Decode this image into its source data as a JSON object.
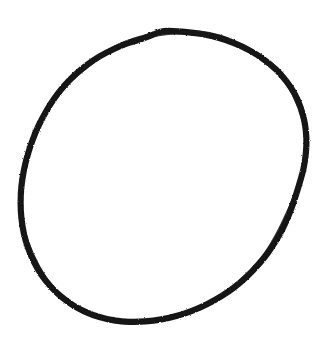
{
  "canvas": {
    "width": 335,
    "height": 355,
    "background_color": "#ffffff",
    "name": "drawing-canvas"
  },
  "artwork": {
    "type": "freehand-sketch",
    "subject": "circle",
    "description": "A single closed hand-drawn circle outline, slightly taller than wide, with a thick rough-edged black marker stroke.",
    "stroke_color": "#151515",
    "stroke_width": 6.2,
    "fill": "none",
    "closed": true,
    "bounds": {
      "left": 20,
      "top": 28,
      "right": 308,
      "bottom": 332,
      "width": 288,
      "height": 304
    },
    "center": {
      "x": 164,
      "y": 180
    },
    "radius_x": 144,
    "radius_y": 152,
    "points": [
      {
        "x": 164.0,
        "y": 31.0
      },
      {
        "x": 182.0,
        "y": 31.6
      },
      {
        "x": 200.0,
        "y": 33.8
      },
      {
        "x": 217.5,
        "y": 37.6
      },
      {
        "x": 234.0,
        "y": 43.2
      },
      {
        "x": 249.5,
        "y": 50.4
      },
      {
        "x": 263.5,
        "y": 59.2
      },
      {
        "x": 276.0,
        "y": 69.6
      },
      {
        "x": 286.5,
        "y": 81.4
      },
      {
        "x": 295.0,
        "y": 94.4
      },
      {
        "x": 301.0,
        "y": 108.4
      },
      {
        "x": 304.8,
        "y": 123.2
      },
      {
        "x": 306.4,
        "y": 138.4
      },
      {
        "x": 305.8,
        "y": 153.8
      },
      {
        "x": 303.4,
        "y": 169.2
      },
      {
        "x": 299.2,
        "y": 184.4
      },
      {
        "x": 294.6,
        "y": 199.2
      },
      {
        "x": 289.4,
        "y": 213.6
      },
      {
        "x": 283.2,
        "y": 227.6
      },
      {
        "x": 275.8,
        "y": 241.0
      },
      {
        "x": 267.2,
        "y": 253.8
      },
      {
        "x": 257.4,
        "y": 265.8
      },
      {
        "x": 246.4,
        "y": 277.0
      },
      {
        "x": 234.4,
        "y": 287.2
      },
      {
        "x": 221.4,
        "y": 296.2
      },
      {
        "x": 207.4,
        "y": 304.0
      },
      {
        "x": 192.6,
        "y": 310.6
      },
      {
        "x": 177.2,
        "y": 315.8
      },
      {
        "x": 161.4,
        "y": 319.4
      },
      {
        "x": 145.4,
        "y": 321.4
      },
      {
        "x": 129.6,
        "y": 321.8
      },
      {
        "x": 114.2,
        "y": 320.4
      },
      {
        "x": 99.4,
        "y": 317.0
      },
      {
        "x": 85.4,
        "y": 311.8
      },
      {
        "x": 72.4,
        "y": 304.8
      },
      {
        "x": 60.6,
        "y": 296.2
      },
      {
        "x": 50.2,
        "y": 286.0
      },
      {
        "x": 41.2,
        "y": 274.4
      },
      {
        "x": 33.8,
        "y": 261.6
      },
      {
        "x": 28.0,
        "y": 247.8
      },
      {
        "x": 23.8,
        "y": 233.2
      },
      {
        "x": 21.4,
        "y": 218.0
      },
      {
        "x": 20.6,
        "y": 202.4
      },
      {
        "x": 21.4,
        "y": 186.6
      },
      {
        "x": 23.8,
        "y": 170.8
      },
      {
        "x": 27.6,
        "y": 155.2
      },
      {
        "x": 32.6,
        "y": 140.0
      },
      {
        "x": 38.8,
        "y": 125.2
      },
      {
        "x": 46.2,
        "y": 111.2
      },
      {
        "x": 54.6,
        "y": 98.0
      },
      {
        "x": 64.2,
        "y": 85.8
      },
      {
        "x": 75.0,
        "y": 74.8
      },
      {
        "x": 86.8,
        "y": 65.0
      },
      {
        "x": 99.6,
        "y": 56.4
      },
      {
        "x": 113.4,
        "y": 49.2
      },
      {
        "x": 128.0,
        "y": 43.2
      },
      {
        "x": 143.4,
        "y": 38.4
      },
      {
        "x": 153.6,
        "y": 34.4
      }
    ],
    "texture_overlay_points": [
      {
        "x": 199.0,
        "y": 32.8
      },
      {
        "x": 240.0,
        "y": 45.0
      },
      {
        "x": 281.0,
        "y": 74.4
      },
      {
        "x": 303.6,
        "y": 120.0
      },
      {
        "x": 305.2,
        "y": 160.0
      },
      {
        "x": 291.2,
        "y": 206.0
      },
      {
        "x": 262.0,
        "y": 259.0
      },
      {
        "x": 214.0,
        "y": 301.0
      },
      {
        "x": 155.0,
        "y": 320.4
      },
      {
        "x": 104.0,
        "y": 318.4
      },
      {
        "x": 56.0,
        "y": 292.0
      },
      {
        "x": 26.0,
        "y": 240.0
      },
      {
        "x": 20.8,
        "y": 194.0
      },
      {
        "x": 30.0,
        "y": 147.0
      },
      {
        "x": 58.0,
        "y": 94.0
      },
      {
        "x": 104.0,
        "y": 54.0
      },
      {
        "x": 148.0,
        "y": 36.0
      }
    ]
  }
}
